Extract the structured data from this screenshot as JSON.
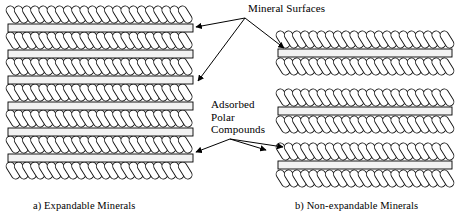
{
  "figure": {
    "background_color": "#ffffff",
    "line_color": "#000000",
    "bar_fill_color": "#f2f2f2",
    "squiggle_fill_color": "#ffffff"
  },
  "labels": {
    "mineral_surfaces": "Mineral Surfaces",
    "adsorbed_polar_compounds_line1": "Adsorbed",
    "adsorbed_polar_compounds_line2": "Polar",
    "adsorbed_polar_compounds_line3": "Compounds"
  },
  "captions": {
    "left": "a) Expandable Minerals",
    "right": "b) Non-expandable Minerals"
  },
  "chart_data": {
    "type": "diagram",
    "panels": [
      {
        "id": "left-panel",
        "caption": "a) Expandable Minerals",
        "description": "Stack of alternating adsorbed polar compound layers (squiggle chains) and mineral surface bars, closely spaced with uniform interlayer separation",
        "x_start": 8,
        "x_end": 193,
        "squiggle_row_count": 7,
        "bar_count": 6,
        "squiggle_rows_y": [
          5,
          31,
          57,
          83,
          109,
          135,
          161
        ],
        "bars_y": [
          24,
          50,
          76,
          102,
          128,
          154
        ],
        "bar_width": 185,
        "bar_height": 8
      },
      {
        "id": "right-panel",
        "caption": "b) Non-expandable Minerals",
        "description": "Three separated groups, each a mineral surface bar sandwiched between two adsorbed polar compound layers, with wide gaps between groups",
        "x_start": 278,
        "x_end": 452,
        "groups": [
          {
            "squiggle_top_y": 30,
            "bar_y": 49,
            "squiggle_bottom_y": 57,
            "bar_width": 174,
            "bar_height": 8
          },
          {
            "squiggle_top_y": 88,
            "bar_y": 107,
            "squiggle_bottom_y": 115,
            "bar_width": 174,
            "bar_height": 8
          },
          {
            "squiggle_top_y": 142,
            "bar_y": 161,
            "squiggle_bottom_y": 169,
            "bar_width": 174,
            "bar_height": 8
          }
        ]
      }
    ],
    "annotations": [
      {
        "name": "mineral-surfaces",
        "text": "Mineral Surfaces",
        "text_position": {
          "x": 248,
          "y": 2
        },
        "origin": {
          "x": 245,
          "y": 18
        },
        "arrow_targets": [
          {
            "x": 196,
            "y": 27
          },
          {
            "x": 198,
            "y": 81
          },
          {
            "x": 284,
            "y": 48
          }
        ]
      },
      {
        "name": "adsorbed-polar-compounds",
        "text": "Adsorbed Polar Compounds",
        "text_position": {
          "x": 211,
          "y": 98
        },
        "origin": {
          "x": 230,
          "y": 139
        },
        "arrow_targets": [
          {
            "x": 196,
            "y": 152
          },
          {
            "x": 266,
            "y": 150
          },
          {
            "x": 283,
            "y": 147
          }
        ]
      }
    ],
    "legend": null,
    "grid": false
  }
}
